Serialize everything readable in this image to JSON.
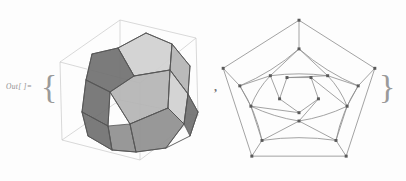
{
  "notebook": {
    "out_label": "Out[ ]=",
    "open_brace": "{",
    "close_brace": "}",
    "separator": ","
  },
  "colors": {
    "background": "#fdfdfd",
    "label_text": "#8d8d8d",
    "brace": "#9a9a9a",
    "comma": "#6f6f6f",
    "bbox_line": "#c9c9c9",
    "face_light": "#d0d0d0",
    "face_mid": "#b4b4b4",
    "face_dark": "#8f8f8f",
    "face_darkest": "#707070",
    "face_edge": "#555555",
    "graph_edge": "#8a8a8a",
    "graph_vertex": "#5a5a5a"
  },
  "figures": [
    {
      "name": "dodecahedron-3d",
      "type": "polyhedron-3d",
      "shape": "dodecahedron",
      "faces": 12,
      "vertices": 20,
      "edges": 30,
      "bounding_box": "wireframe-cube",
      "shading": "grayscale-flat"
    },
    {
      "name": "dodecahedron-schlegel",
      "type": "planar-graph",
      "shape": "schlegel-diagram",
      "vertices": 20,
      "edges": 30,
      "faces": 12
    }
  ],
  "polyhedron": {
    "bbox": [
      [
        12,
        62
      ],
      [
        72,
        20
      ],
      [
        148,
        38
      ],
      [
        92,
        83
      ],
      [
        14,
        140
      ],
      [
        72,
        100
      ],
      [
        150,
        116
      ],
      [
        92,
        160
      ]
    ],
    "faces": [
      {
        "id": "f-top",
        "tone": "face_light",
        "pts": "70,48 98,33 124,44 122,70 86,76"
      },
      {
        "id": "f-top-right",
        "tone": "face_mid",
        "pts": "124,44 142,66 140,94 122,70"
      },
      {
        "id": "f-upper-left",
        "tone": "face_darkest",
        "pts": "44,54 70,48 86,76 62,92 38,80"
      },
      {
        "id": "f-left-dark",
        "tone": "face_darkest",
        "pts": "38,80 62,92 60,126 34,112"
      },
      {
        "id": "f-front",
        "tone": "face_mid",
        "pts": "62,92 86,76 122,70 120,108 82,124"
      },
      {
        "id": "f-right",
        "tone": "face_light",
        "pts": "122,70 140,94 136,124 120,108"
      },
      {
        "id": "f-lower-left",
        "tone": "face_dark",
        "pts": "60,126 82,124 88,152 64,150"
      },
      {
        "id": "f-bottom",
        "tone": "face_dark",
        "pts": "82,124 120,108 136,124 118,148 88,152"
      },
      {
        "id": "f-bottom-r",
        "tone": "face_darkest",
        "pts": "136,124 140,94 150,112 142,136"
      },
      {
        "id": "f-side-left",
        "tone": "face_darkest",
        "pts": "34,112 60,126 64,150 40,136"
      }
    ],
    "edges": [
      "70,48 98,33",
      "98,33 124,44",
      "124,44 122,70",
      "122,70 86,76",
      "86,76 70,48",
      "124,44 142,66",
      "142,66 140,94",
      "140,94 122,70",
      "44,54 70,48",
      "86,76 62,92",
      "62,92 38,80",
      "38,80 44,54",
      "38,80 34,112",
      "34,112 60,126",
      "60,126 62,92",
      "62,92 82,124",
      "82,124 120,108",
      "120,108 122,70",
      "120,108 136,124",
      "136,124 140,94",
      "136,124 118,148",
      "60,126 64,150",
      "64,150 88,152",
      "88,152 82,124",
      "88,152 118,148",
      "140,94 150,112",
      "150,112 142,136",
      "142,136 118,148",
      "34,112 40,136",
      "40,136 64,150"
    ]
  },
  "schlegel": {
    "outer": [
      [
        93,
        10
      ],
      [
        11,
        62
      ],
      [
        42,
        157
      ],
      [
        144,
        157
      ],
      [
        175,
        62
      ]
    ],
    "mid_outer": [
      [
        93,
        41
      ],
      [
        29,
        81
      ],
      [
        53,
        140
      ],
      [
        133,
        140
      ],
      [
        157,
        81
      ]
    ],
    "mid_inner": [
      [
        62,
        70
      ],
      [
        41,
        103
      ],
      [
        93,
        119
      ],
      [
        145,
        103
      ],
      [
        124,
        70
      ]
    ],
    "inner": [
      [
        72,
        95
      ],
      [
        93,
        110
      ],
      [
        114,
        95
      ],
      [
        106,
        72
      ],
      [
        80,
        72
      ]
    ],
    "spokes": [
      [
        0,
        0
      ],
      [
        1,
        1
      ],
      [
        2,
        2
      ],
      [
        3,
        3
      ],
      [
        4,
        4
      ]
    ]
  }
}
